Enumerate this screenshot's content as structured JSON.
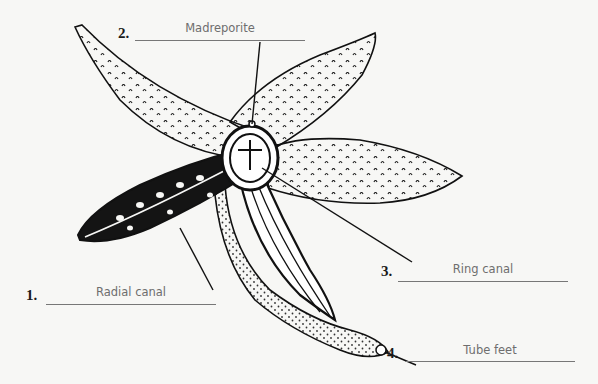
{
  "diagram": {
    "colors": {
      "ink": "#111111",
      "background": "#f7f7f5",
      "answer_text": "#6e6e6e",
      "answer_line": "#777777"
    },
    "labels": [
      {
        "number": "1.",
        "answer": "Radial canal"
      },
      {
        "number": "2.",
        "answer": "Madreporite"
      },
      {
        "number": "3.",
        "answer": "Ring canal"
      },
      {
        "number": "4.",
        "answer": "Tube feet"
      }
    ]
  }
}
